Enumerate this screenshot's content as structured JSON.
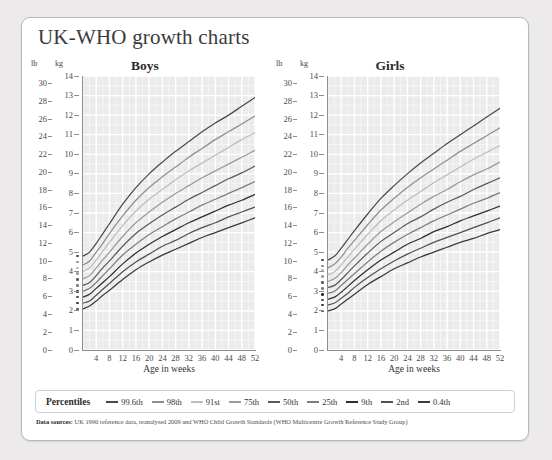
{
  "title": "UK-WHO growth charts",
  "units": {
    "lb": "lb",
    "kg": "kg"
  },
  "panels": [
    {
      "key": "boys",
      "title": "Boys"
    },
    {
      "key": "girls",
      "title": "Girls"
    }
  ],
  "axes": {
    "xlabel": "Age in weeks",
    "xticks": [
      4,
      8,
      12,
      16,
      20,
      24,
      28,
      32,
      36,
      40,
      44,
      48,
      52
    ],
    "xlim": [
      0,
      52
    ],
    "kg_ticks": [
      0,
      1,
      2,
      3,
      4,
      5,
      6,
      7,
      8,
      9,
      10,
      11,
      12,
      13,
      14
    ],
    "kg_label": "kg",
    "kglim": [
      0,
      14
    ],
    "lb_ticks": [
      0,
      2,
      4,
      6,
      8,
      10,
      12,
      14,
      16,
      18,
      20,
      22,
      24,
      26,
      28,
      30
    ],
    "lb_label": "lb",
    "lblim": [
      0,
      30.86
    ]
  },
  "legend": {
    "title": "Percentiles",
    "items": [
      {
        "label": "99.6th",
        "color": "#4a4a4a"
      },
      {
        "label": "98th",
        "color": "#8f8f8f"
      },
      {
        "label": "91st",
        "color": "#bdbdbd"
      },
      {
        "label": "75th",
        "color": "#9a9a9a"
      },
      {
        "label": "50th",
        "color": "#5a5a5a"
      },
      {
        "label": "25th",
        "color": "#7d7d7d"
      },
      {
        "label": "9th",
        "color": "#2f2f2f"
      },
      {
        "label": "2nd",
        "color": "#515151"
      },
      {
        "label": "0.4th",
        "color": "#3a3a3a"
      }
    ]
  },
  "footer": {
    "bold": "Data sources:",
    "text": " UK 1990 reference data, reanalysed 2009 and WHO Child Growth Standards (WHO Multicentre Growth Reference Study Group)"
  },
  "chart_data": {
    "type": "line",
    "title": "UK-WHO growth charts",
    "xlabel": "Age in weeks",
    "ylabel": "Weight (kg / lb)",
    "xlim": [
      0,
      52
    ],
    "ylim": [
      0,
      14
    ],
    "grid": true,
    "legend_position": "bottom",
    "x": [
      0,
      2,
      4,
      6,
      8,
      12,
      16,
      20,
      24,
      28,
      32,
      36,
      40,
      44,
      48,
      52
    ],
    "charts": [
      {
        "name": "Boys",
        "birth_markers_kg": [
          4.8,
          4.5,
          4.2,
          3.9,
          3.6,
          3.3,
          3.0,
          2.7,
          2.4,
          2.1
        ],
        "series": [
          {
            "name": "99.6th",
            "color": "#4a4a4a",
            "values": [
              4.8,
              5.0,
              5.45,
              5.95,
              6.45,
              7.45,
              8.3,
              9.0,
              9.6,
              10.15,
              10.65,
              11.15,
              11.6,
              12.0,
              12.45,
              12.9
            ]
          },
          {
            "name": "98th",
            "color": "#8f8f8f",
            "values": [
              4.35,
              4.55,
              5.0,
              5.45,
              5.95,
              6.85,
              7.65,
              8.3,
              8.85,
              9.35,
              9.85,
              10.3,
              10.75,
              11.15,
              11.55,
              11.95
            ]
          },
          {
            "name": "91st",
            "color": "#bdbdbd",
            "values": [
              4.0,
              4.2,
              4.6,
              5.05,
              5.5,
              6.35,
              7.1,
              7.7,
              8.2,
              8.7,
              9.15,
              9.55,
              9.95,
              10.35,
              10.75,
              11.1
            ]
          },
          {
            "name": "75th",
            "color": "#9a9a9a",
            "values": [
              3.65,
              3.8,
              4.2,
              4.6,
              5.0,
              5.8,
              6.5,
              7.05,
              7.55,
              8.0,
              8.4,
              8.8,
              9.15,
              9.5,
              9.85,
              10.2
            ]
          },
          {
            "name": "50th",
            "color": "#5a5a5a",
            "values": [
              3.3,
              3.45,
              3.8,
              4.2,
              4.55,
              5.3,
              5.95,
              6.45,
              6.9,
              7.3,
              7.7,
              8.05,
              8.4,
              8.75,
              9.05,
              9.4
            ]
          },
          {
            "name": "25th",
            "color": "#7d7d7d",
            "values": [
              3.0,
              3.15,
              3.45,
              3.8,
              4.15,
              4.85,
              5.4,
              5.9,
              6.3,
              6.7,
              7.05,
              7.4,
              7.7,
              8.0,
              8.3,
              8.6
            ]
          },
          {
            "name": "9th",
            "color": "#2f2f2f",
            "values": [
              2.7,
              2.85,
              3.15,
              3.45,
              3.75,
              4.4,
              4.95,
              5.4,
              5.8,
              6.15,
              6.5,
              6.8,
              7.1,
              7.4,
              7.65,
              7.95
            ]
          },
          {
            "name": "2nd",
            "color": "#515151",
            "values": [
              2.4,
              2.5,
              2.8,
              3.1,
              3.4,
              4.0,
              4.5,
              4.9,
              5.3,
              5.6,
              5.95,
              6.25,
              6.5,
              6.8,
              7.05,
              7.3
            ]
          },
          {
            "name": "0.4th",
            "color": "#3a3a3a",
            "values": [
              2.1,
              2.25,
              2.5,
              2.8,
              3.05,
              3.6,
              4.1,
              4.5,
              4.85,
              5.15,
              5.45,
              5.75,
              6.0,
              6.25,
              6.5,
              6.75
            ]
          }
        ]
      },
      {
        "name": "Girls",
        "birth_markers_kg": [
          4.6,
          4.3,
          4.05,
          3.75,
          3.45,
          3.15,
          2.85,
          2.55,
          2.3,
          2.0
        ],
        "series": [
          {
            "name": "99.6th",
            "color": "#4a4a4a",
            "values": [
              4.6,
              4.8,
              5.2,
              5.65,
              6.1,
              6.95,
              7.75,
              8.4,
              9.0,
              9.55,
              10.05,
              10.55,
              11.0,
              11.45,
              11.9,
              12.35
            ]
          },
          {
            "name": "98th",
            "color": "#8f8f8f",
            "values": [
              4.2,
              4.4,
              4.75,
              5.2,
              5.6,
              6.4,
              7.15,
              7.75,
              8.3,
              8.8,
              9.25,
              9.7,
              10.15,
              10.55,
              10.95,
              11.35
            ]
          },
          {
            "name": "91st",
            "color": "#bdbdbd",
            "values": [
              3.85,
              4.0,
              4.35,
              4.75,
              5.15,
              5.9,
              6.6,
              7.15,
              7.65,
              8.1,
              8.55,
              8.95,
              9.35,
              9.75,
              10.1,
              10.45
            ]
          },
          {
            "name": "75th",
            "color": "#9a9a9a",
            "values": [
              3.5,
              3.65,
              3.95,
              4.35,
              4.7,
              5.4,
              6.05,
              6.55,
              7.0,
              7.45,
              7.85,
              8.2,
              8.6,
              8.95,
              9.25,
              9.6
            ]
          },
          {
            "name": "50th",
            "color": "#5a5a5a",
            "values": [
              3.2,
              3.3,
              3.6,
              3.95,
              4.3,
              4.95,
              5.55,
              6.0,
              6.45,
              6.8,
              7.2,
              7.55,
              7.85,
              8.2,
              8.5,
              8.8
            ]
          },
          {
            "name": "25th",
            "color": "#7d7d7d",
            "values": [
              2.9,
              3.0,
              3.3,
              3.6,
              3.9,
              4.5,
              5.05,
              5.5,
              5.9,
              6.25,
              6.6,
              6.9,
              7.2,
              7.5,
              7.75,
              8.05
            ]
          },
          {
            "name": "9th",
            "color": "#2f2f2f",
            "values": [
              2.6,
              2.7,
              2.95,
              3.25,
              3.55,
              4.1,
              4.6,
              5.0,
              5.4,
              5.7,
              6.05,
              6.3,
              6.6,
              6.85,
              7.1,
              7.35
            ]
          },
          {
            "name": "2nd",
            "color": "#515151",
            "values": [
              2.3,
              2.4,
              2.65,
              2.9,
              3.2,
              3.7,
              4.15,
              4.55,
              4.9,
              5.2,
              5.5,
              5.75,
              6.0,
              6.25,
              6.5,
              6.75
            ]
          },
          {
            "name": "0.4th",
            "color": "#3a3a3a",
            "values": [
              2.0,
              2.1,
              2.35,
              2.6,
              2.85,
              3.35,
              3.75,
              4.15,
              4.45,
              4.75,
              5.0,
              5.25,
              5.5,
              5.7,
              5.95,
              6.15
            ]
          }
        ]
      }
    ]
  }
}
